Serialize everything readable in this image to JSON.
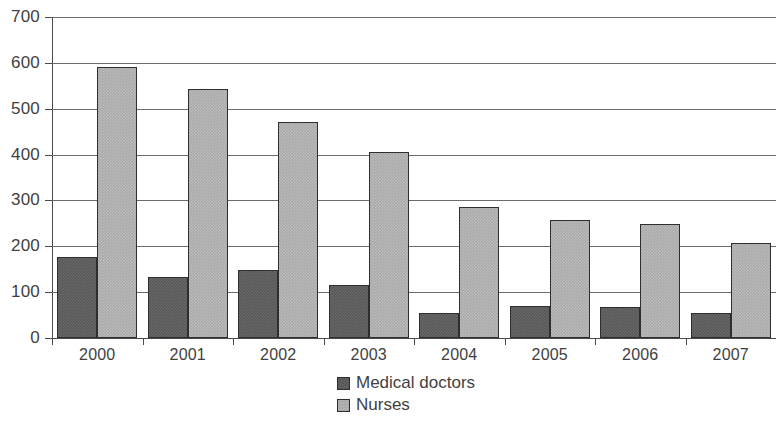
{
  "chart_data": {
    "type": "bar",
    "title": "",
    "subtitle": "",
    "xlabel": "",
    "ylabel": "",
    "categories": [
      "2000",
      "2001",
      "2002",
      "2003",
      "2004",
      "2005",
      "2006",
      "2007"
    ],
    "series": [
      {
        "name": "Medical doctors",
        "color": "#585858",
        "values": [
          177,
          133,
          148,
          116,
          55,
          70,
          67,
          55
        ]
      },
      {
        "name": "Nurses",
        "color": "#a9a9a9",
        "values": [
          592,
          543,
          472,
          405,
          285,
          257,
          248,
          207
        ]
      }
    ],
    "ylim": [
      0,
      700
    ],
    "ytick_step": 100,
    "yticks": [
      "0",
      "100",
      "200",
      "300",
      "400",
      "500",
      "600",
      "700"
    ],
    "grid": true,
    "grid_axis": "y",
    "legend_position": "bottom-center",
    "axis_color": "#4a4a4a",
    "grid_color": "#6b6b6b",
    "text_color": "#3f3f3f",
    "background": "#ffffff"
  }
}
